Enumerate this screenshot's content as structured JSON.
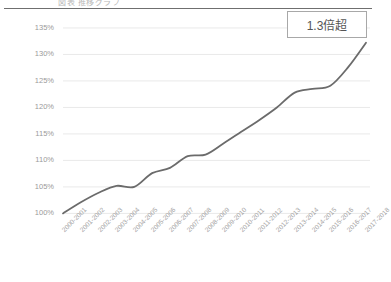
{
  "header": {
    "clipped_title": "図表 推移グラフ",
    "rule_color": "#6f6f6f"
  },
  "annotations": {
    "callout_label": "1.3倍超"
  },
  "colors": {
    "line": "#6b6b6b",
    "gridline": "#e9e9e9",
    "axis_text": "#9a9a9a",
    "callout_border": "#a8a8a8",
    "background": "#ffffff"
  },
  "chart_data": {
    "type": "line",
    "title": "",
    "xlabel": "",
    "ylabel": "",
    "ylim": [
      98,
      136.5
    ],
    "yticks": [
      100,
      105,
      110,
      115,
      120,
      125,
      130,
      135
    ],
    "ytick_labels": [
      "100%",
      "105%",
      "110%",
      "115%",
      "120%",
      "125%",
      "130%",
      "135%"
    ],
    "grid": true,
    "legend": "none",
    "categories": [
      "2000-2001",
      "2001-2002",
      "2002-2003",
      "2003-2004",
      "2004-2005",
      "2005-2006",
      "2006-2007",
      "2007-2008",
      "2008-2009",
      "2009-2010",
      "2010-2011",
      "2011-2012",
      "2012-2013",
      "2013-2014",
      "2014-2015",
      "2015-2016",
      "2016-2017",
      "2017-2018"
    ],
    "series": [
      {
        "name": "index",
        "values": [
          100.0,
          102.1,
          103.9,
          105.2,
          105.0,
          107.6,
          108.6,
          110.8,
          111.1,
          113.2,
          115.4,
          117.6,
          120.0,
          122.8,
          123.5,
          124.1,
          127.6,
          132.2
        ]
      }
    ],
    "annotations": [
      {
        "text": "1.3倍超",
        "type": "box",
        "position": "top-right"
      }
    ]
  }
}
